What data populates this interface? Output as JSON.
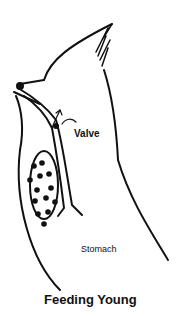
{
  "diagram": {
    "title": "Feeding Young",
    "labels": {
      "valve": "Valve",
      "stomach": "Stomach"
    },
    "colors": {
      "line": "#111111",
      "background": "#ffffff"
    }
  }
}
